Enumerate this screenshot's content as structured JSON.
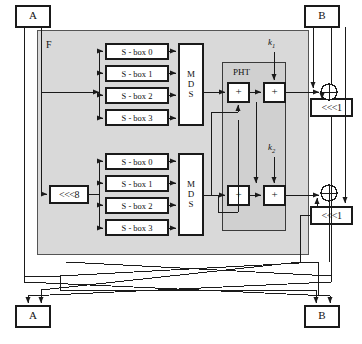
{
  "diagram": {
    "colors": {
      "stroke": "#1a1a1a",
      "f_fill": "#d9d9d9",
      "pht_fill": "#d0d0d0",
      "box_fill": "#ffffff",
      "page": "#ffffff"
    },
    "f_label": "F",
    "pht_label": "PHT",
    "top_registers": [
      {
        "name": "register-a-top",
        "label": "A"
      },
      {
        "name": "register-b-top",
        "label": "B"
      }
    ],
    "bottom_registers": [
      {
        "name": "register-a-bottom",
        "label": "A"
      },
      {
        "name": "register-b-bottom",
        "label": "B"
      }
    ],
    "sboxes_upper": [
      {
        "label": "S - box 0"
      },
      {
        "label": "S - box 1"
      },
      {
        "label": "S - box 2"
      },
      {
        "label": "S - box 3"
      }
    ],
    "sboxes_lower": [
      {
        "label": "S - box 0"
      },
      {
        "label": "S - box 1"
      },
      {
        "label": "S - box 2"
      },
      {
        "label": "S - box 3"
      }
    ],
    "mds_upper": {
      "label": "MDS",
      "lines": [
        "M",
        "D",
        "S"
      ]
    },
    "mds_lower": {
      "label": "MDS",
      "lines": [
        "M",
        "D",
        "S"
      ]
    },
    "rotate_input": {
      "label": "<<<8",
      "amount": 8
    },
    "rotate_out_upper": {
      "label": "<<<1",
      "amount": 1
    },
    "rotate_out_lower": {
      "label": "<<<1",
      "amount": 1
    },
    "adders": [
      {
        "name": "pht-adder-upper",
        "label": "+"
      },
      {
        "name": "key-adder-upper",
        "label": "+"
      },
      {
        "name": "pht-adder-lower",
        "label": "+"
      },
      {
        "name": "key-adder-lower",
        "label": "+"
      }
    ],
    "subkeys": [
      {
        "name": "subkey-k1",
        "base": "k",
        "sub": "1"
      },
      {
        "name": "subkey-k2",
        "base": "k",
        "sub": "2"
      }
    ],
    "xors": [
      {
        "name": "xor-upper",
        "glyph": "+"
      },
      {
        "name": "xor-lower",
        "glyph": "+"
      }
    ]
  }
}
